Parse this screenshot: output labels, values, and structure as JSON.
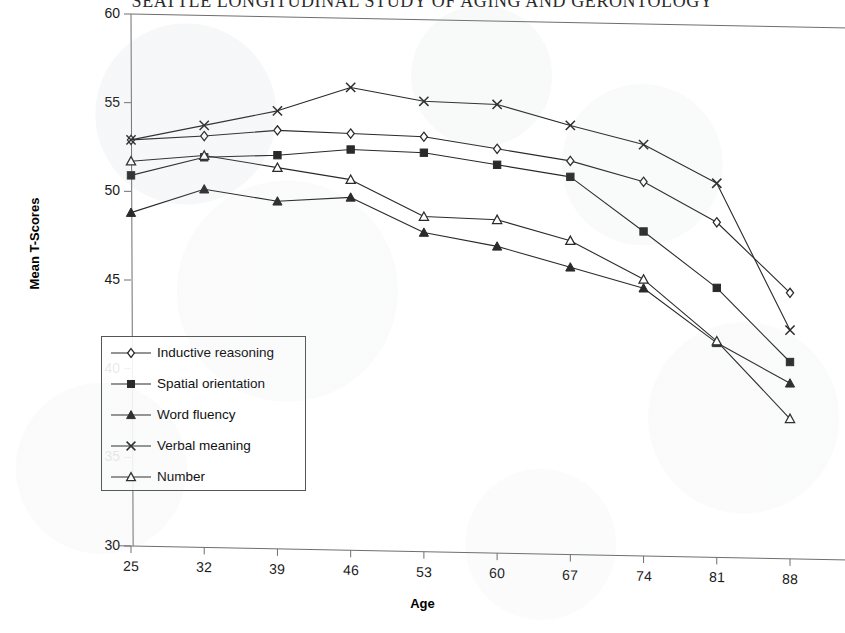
{
  "chart_data": {
    "type": "line",
    "title": "SEATTLE LONGITUDINAL STUDY OF AGING AND GERONTOLOGY",
    "xlabel": "Age",
    "ylabel": "Mean T-Scores",
    "categories": [
      25,
      32,
      39,
      46,
      53,
      60,
      67,
      74,
      81,
      88
    ],
    "x_tick_labels": [
      "25",
      "32",
      "39",
      "46",
      "53",
      "60",
      "67",
      "74",
      "81",
      "88"
    ],
    "y_tick_labels": [
      "30",
      "35",
      "40",
      "45",
      "50",
      "55",
      "60"
    ],
    "y_ticks": [
      30,
      35,
      40,
      45,
      50,
      55,
      60
    ],
    "ylim": [
      30,
      60
    ],
    "grid": false,
    "legend_position": "inside-lower-left",
    "series": [
      {
        "name": "Inductive reasoning",
        "marker": "open-diamond",
        "values": [
          52.9,
          53.2,
          53.6,
          53.5,
          53.4,
          52.8,
          52.2,
          51.1,
          48.9,
          45.0
        ]
      },
      {
        "name": "Spatial orientation",
        "marker": "filled-square",
        "values": [
          50.9,
          52.0,
          52.2,
          52.6,
          52.5,
          51.9,
          51.3,
          48.3,
          45.2,
          41.1
        ]
      },
      {
        "name": "Word fluency",
        "marker": "filled-triangle",
        "values": [
          48.8,
          50.2,
          49.6,
          49.9,
          48.0,
          47.3,
          46.2,
          45.1,
          42.1,
          39.9
        ]
      },
      {
        "name": "Verbal meaning",
        "marker": "cross-x",
        "values": [
          52.9,
          53.8,
          54.7,
          56.1,
          55.4,
          55.3,
          54.2,
          53.2,
          51.1,
          42.9
        ]
      },
      {
        "name": "Number",
        "marker": "open-triangle",
        "values": [
          51.7,
          52.1,
          51.5,
          50.9,
          48.9,
          48.8,
          47.7,
          45.6,
          42.2,
          37.9
        ]
      }
    ]
  },
  "axis": {
    "y_title": "Mean T-Scores",
    "x_title": "Age"
  },
  "legend": {
    "items": [
      {
        "label": "Inductive reasoning",
        "marker": "open-diamond"
      },
      {
        "label": "Spatial orientation",
        "marker": "filled-square"
      },
      {
        "label": "Word fluency",
        "marker": "filled-triangle"
      },
      {
        "label": "Verbal meaning",
        "marker": "cross-x"
      },
      {
        "label": "Number",
        "marker": "open-triangle"
      }
    ]
  },
  "colors": {
    "line": "#2a2a2a",
    "axis": "#6e6e6e",
    "text": "#111111",
    "background": "#ffffff"
  }
}
